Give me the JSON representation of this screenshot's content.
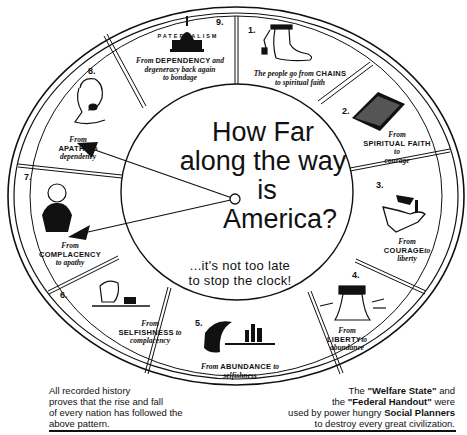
{
  "center": {
    "title_lines": [
      "How Far",
      "along the way",
      "is",
      "America?"
    ],
    "subtitle_lines": [
      "...it's not too late",
      "to stop the clock!"
    ]
  },
  "segments": [
    {
      "number": "1.",
      "icon": "chained-foot-icon",
      "line1_pre": "The people go from ",
      "line1_bold": "CHAINS",
      "line2": "to spiritual faith"
    },
    {
      "number": "2.",
      "icon": "bible-icon",
      "from": "From",
      "bold": "SPIRITUAL FAITH",
      "to": "to",
      "end": "courage"
    },
    {
      "number": "3.",
      "icon": "horse-rider-icon",
      "from": "From",
      "bold": "COURAGE",
      "to": "to",
      "end": "liberty"
    },
    {
      "number": "4.",
      "icon": "liberty-bell-icon",
      "from": "From",
      "bold": "LIBERTY",
      "to": "to",
      "end": "abundance"
    },
    {
      "number": "5.",
      "icon": "cornucopia-city-icon",
      "from": "From ",
      "bold": "ABUNDANCE",
      "to": " to",
      "end": "selfishness"
    },
    {
      "number": "6.",
      "icon": "grasping-hand-icon",
      "from": "From",
      "bold": "SELFISHNESS",
      "to": " to",
      "end": "complacency"
    },
    {
      "number": "7.",
      "icon": "smug-man-icon",
      "from": "From",
      "bold": "COMPLACENCY",
      "to": "",
      "end": "to apathy"
    },
    {
      "number": "8.",
      "icon": "yawning-man-icon",
      "from": "From",
      "bold": "APATHY",
      "to": " to",
      "end": "dependency"
    },
    {
      "number": "9.",
      "icon": "capitol-dome-icon",
      "label": "PATERNALISM",
      "from": "From ",
      "bold": "DEPENDENCY",
      "to": " and",
      "line2": "degeneracy back again",
      "line3": "to bondage"
    }
  ],
  "footer": {
    "left_lines": [
      "All recorded history",
      "proves that the rise and fall",
      "of every nation has followed the",
      "above pattern."
    ],
    "right": {
      "l1_pre": "The ",
      "l1_bold": "\"Welfare State\"",
      "l1_post": " and",
      "l2_pre": "the ",
      "l2_bold": "\"Federal Handout\"",
      "l2_post": " were",
      "l3_pre": "used by power hungry ",
      "l3_bold": "Social Planners",
      "l4": "to destroy every great civilization."
    }
  },
  "colors": {
    "ink": "#111111",
    "paper": "#ffffff"
  }
}
